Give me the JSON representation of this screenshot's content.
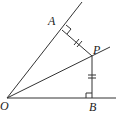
{
  "diagram": {
    "type": "geometry",
    "points": {
      "O": {
        "label": "O",
        "x": 7,
        "y": 98
      },
      "A": {
        "label": "A",
        "x": 62,
        "y": 30
      },
      "P": {
        "label": "P",
        "x": 92,
        "y": 56
      },
      "B": {
        "label": "B",
        "x": 92,
        "y": 98
      }
    },
    "labels": {
      "O": "O",
      "A": "A",
      "P": "P",
      "B": "B"
    },
    "segments": [
      {
        "name": "ray-OA",
        "from": "O",
        "to": "A-extended"
      },
      {
        "name": "ray-OB",
        "from": "O",
        "to": "B-extended"
      },
      {
        "name": "bisector-OP",
        "from": "O",
        "to": "P-extended"
      },
      {
        "name": "PA",
        "from": "P",
        "to": "A",
        "tick_marks": 2
      },
      {
        "name": "PB",
        "from": "P",
        "to": "B",
        "tick_marks": 2
      }
    ],
    "right_angles": [
      "A",
      "B"
    ]
  }
}
